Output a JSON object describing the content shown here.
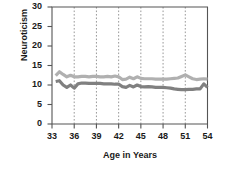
{
  "chart_data": {
    "type": "line",
    "title": "",
    "xlabel": "Age in Years",
    "ylabel": "Neuroticism",
    "xlim": [
      33,
      54
    ],
    "ylim": [
      0,
      30
    ],
    "yticks": [
      0,
      5,
      10,
      15,
      20,
      25,
      30
    ],
    "xticks": [
      33,
      36,
      39,
      42,
      45,
      48,
      51,
      54
    ],
    "grid": "vertical-dotted",
    "legend": "none",
    "colors": {
      "series_upper": "#b0b0b0",
      "series_lower": "#808080",
      "axis": "#555555",
      "gridline": "#999999",
      "text": "#1a1a1a",
      "background": "#ffffff"
    },
    "x": [
      33.5,
      34,
      34.5,
      35,
      35.5,
      36,
      36.5,
      37,
      37.5,
      38,
      38.5,
      39,
      39.5,
      40,
      40.5,
      41,
      41.5,
      42,
      42.5,
      43,
      43.5,
      44,
      44.5,
      45,
      45.5,
      46,
      46.5,
      47,
      47.5,
      48,
      48.5,
      49,
      49.5,
      50,
      50.5,
      51,
      51.5,
      52,
      52.5,
      53,
      53.5,
      54
    ],
    "series": [
      {
        "name": "upper-line",
        "color": "#b0b0b0",
        "values": [
          12.4,
          13.4,
          12.7,
          12.1,
          12.5,
          12.1,
          12.1,
          12.2,
          12.2,
          12.1,
          12.2,
          12.2,
          12.1,
          12.1,
          12.2,
          12.1,
          12.3,
          12.1,
          11.4,
          11.5,
          12.0,
          11.6,
          12.1,
          11.7,
          11.6,
          11.6,
          11.6,
          11.5,
          11.5,
          11.5,
          11.5,
          11.6,
          11.7,
          11.8,
          12.2,
          12.6,
          12.1,
          11.6,
          11.4,
          11.5,
          11.6,
          11.5
        ]
      },
      {
        "name": "lower-line",
        "color": "#808080",
        "values": [
          10.9,
          11.1,
          10.0,
          9.4,
          10.0,
          9.2,
          10.3,
          10.5,
          10.5,
          10.4,
          10.4,
          10.4,
          10.4,
          10.3,
          10.3,
          10.3,
          10.2,
          10.2,
          9.6,
          9.4,
          9.9,
          9.5,
          10.0,
          9.6,
          9.5,
          9.6,
          9.5,
          9.4,
          9.4,
          9.4,
          9.3,
          9.2,
          9.0,
          8.9,
          8.8,
          8.8,
          8.9,
          8.9,
          9.0,
          9.0,
          10.3,
          9.4
        ]
      }
    ]
  }
}
